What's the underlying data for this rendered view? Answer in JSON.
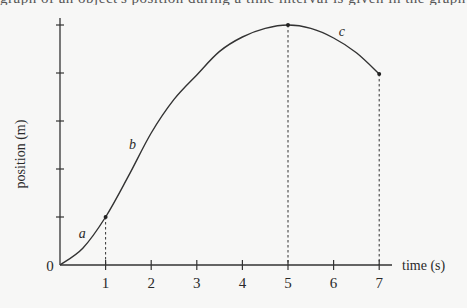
{
  "page": {
    "cut_off_text": "graph of an object's position during a time interval is given in the graph below"
  },
  "chart_data": {
    "type": "line",
    "title": "",
    "xlabel": "time (s)",
    "ylabel": "position (m)",
    "origin_label": "0",
    "x_ticks": [
      "1",
      "2",
      "3",
      "4",
      "5",
      "6",
      "7"
    ],
    "y_ticks_count": 5,
    "y_tick_labels": [],
    "xlim": [
      0,
      7.3
    ],
    "ylim": [
      0,
      5.1
    ],
    "grid": false,
    "legend": null,
    "series": [
      {
        "name": "position",
        "x": [
          0,
          0.5,
          1,
          1.5,
          2,
          2.5,
          3,
          3.5,
          4,
          4.5,
          5,
          5.5,
          6,
          6.5,
          7
        ],
        "values": [
          0,
          0.35,
          1.0,
          1.85,
          2.75,
          3.45,
          3.96,
          4.45,
          4.75,
          4.93,
          5.0,
          4.93,
          4.73,
          4.42,
          3.98
        ]
      }
    ],
    "marked_points": [
      {
        "x": 1,
        "y": 1.0
      },
      {
        "x": 5,
        "y": 5.0
      },
      {
        "x": 7,
        "y": 3.98
      }
    ],
    "dashed_drops": [
      1,
      5,
      7
    ],
    "annotations": [
      {
        "text": "a",
        "x": 0.5,
        "y": 0.65
      },
      {
        "text": "b",
        "x": 1.6,
        "y": 2.5
      },
      {
        "text": "c",
        "x": 6.2,
        "y": 4.85
      }
    ]
  }
}
